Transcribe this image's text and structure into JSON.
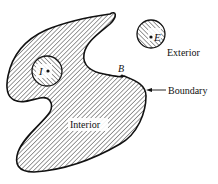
{
  "diagram": {
    "type": "set-topology-illustration",
    "labels": {
      "interior_point": "I",
      "exterior_point": "E",
      "boundary_point": "B",
      "exterior": "Exterior",
      "boundary": "Boundary",
      "interior": "Interior"
    },
    "elements": [
      {
        "id": "region",
        "kind": "hatched-blob",
        "label": "Interior"
      },
      {
        "id": "interior-neighborhood",
        "kind": "hatched-circle",
        "center_label": "I"
      },
      {
        "id": "exterior-neighborhood",
        "kind": "hatched-circle",
        "center_label": "E"
      },
      {
        "id": "boundary-point",
        "kind": "dot",
        "label": "B"
      },
      {
        "id": "boundary-arrow",
        "kind": "arrow",
        "label": "Boundary"
      }
    ],
    "colors": {
      "ink": "#111111",
      "background": "#ffffff"
    }
  }
}
